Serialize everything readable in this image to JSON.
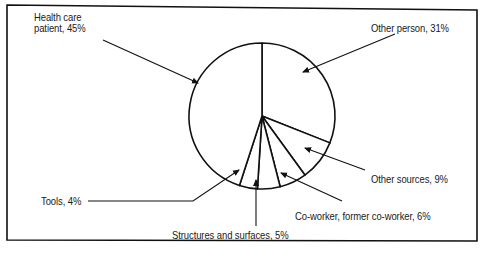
{
  "chart_data": {
    "type": "pie",
    "title": "",
    "categories": [
      "Other person",
      "Other sources",
      "Co-worker, former co-worker",
      "Structures and surfaces",
      "Tools",
      "Health care patient"
    ],
    "values": [
      31,
      9,
      6,
      5,
      4,
      45
    ],
    "unit": "%",
    "labels": [
      "Other person, 31%",
      "Other sources, 9%",
      "Co-worker, former co-worker, 6%",
      "Structures and surfaces, 5%",
      "Tools, 4%",
      "Health care patient, 45%"
    ],
    "legend": "none (callout labels with arrows)",
    "start_angle": "12 o'clock, clockwise",
    "colors": {
      "fill": "#ffffff",
      "stroke": "#111111"
    }
  },
  "labels": {
    "health_care_line1": "Health care",
    "health_care_line2": "patient, 45%",
    "other_person": "Other person, 31%",
    "other_sources": "Other sources, 9%",
    "coworker": "Co-worker, former co-worker, 6%",
    "structures": "Structures and surfaces, 5%",
    "tools": "Tools, 4%"
  }
}
